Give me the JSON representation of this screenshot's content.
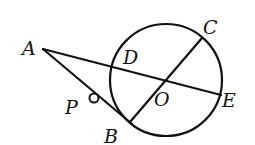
{
  "diagram": {
    "type": "geometry",
    "circle": {
      "center": "O",
      "cx": 166,
      "cy": 80,
      "r": 56
    },
    "points": {
      "A": {
        "label": "A",
        "x": 43,
        "y": 49
      },
      "B": {
        "label": "B",
        "x": 130,
        "y": 122
      },
      "C": {
        "label": "C",
        "x": 202,
        "y": 38
      },
      "D": {
        "label": "D",
        "x": 111,
        "y": 67
      },
      "E": {
        "label": "E",
        "x": 221,
        "y": 95
      },
      "O": {
        "label": "O",
        "x": 166,
        "y": 80
      },
      "P": {
        "label": "P",
        "x": 94,
        "y": 98
      }
    },
    "segments": [
      {
        "from": "A",
        "to": "E"
      },
      {
        "from": "A",
        "to": "B"
      },
      {
        "from": "B",
        "to": "C"
      }
    ],
    "labels": {
      "A": "A",
      "B": "B",
      "C": "C",
      "D": "D",
      "E": "E",
      "O": "O",
      "P": "P"
    }
  }
}
